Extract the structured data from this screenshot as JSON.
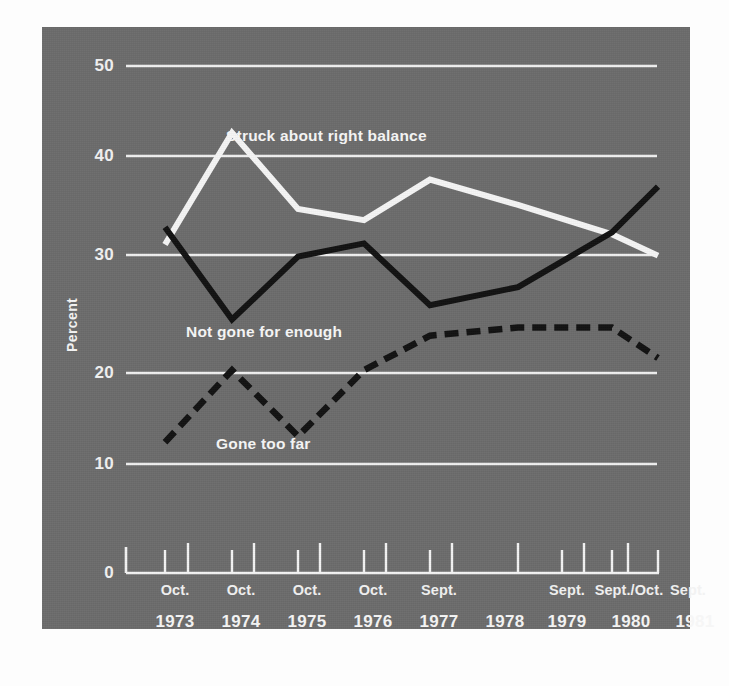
{
  "clipped_top_text": "g",
  "colors": {
    "panel_bg": "#6c6c6c",
    "grid": "#f0f0f0",
    "axis": "#f4f4f4",
    "series_white": "#f5f5f5",
    "series_black": "#111111",
    "text": "#f4f4f4",
    "page_bg": "#fdfdfd"
  },
  "chart_data": {
    "type": "line",
    "title": "",
    "xlabel": "",
    "ylabel": "Percent",
    "ylim": [
      0,
      50
    ],
    "yticks": [
      0,
      10,
      20,
      30,
      40,
      50
    ],
    "grid": true,
    "grid_axis": "y",
    "legend": "inline-annotations",
    "x": [
      "Oct. 1973",
      "1974a",
      "Oct. 1974",
      "1975a",
      "Oct. 1975",
      "1976a",
      "Oct. 1976",
      "1977a",
      "Sept. 1977",
      "1978",
      "Sept. 1979",
      "1980a",
      "Sept./Oct. 1980",
      "1981a",
      "Sept. 1981"
    ],
    "x_axis_years": [
      "1973",
      "1974",
      "1975",
      "1976",
      "1977",
      "1978",
      "1979",
      "1980",
      "1981"
    ],
    "x_axis_months": [
      "Oct.",
      "Oct.",
      "Oct.",
      "Oct.",
      "Sept.",
      "",
      "Sept.",
      "Sept./Oct.",
      "Sept."
    ],
    "series": [
      {
        "name": "Struck about right balance",
        "style": "solid",
        "color": "#f5f5f5",
        "points": [
          {
            "x": "Oct. 1973",
            "y": 32.4
          },
          {
            "x": "Oct. 1974",
            "y": 43.4
          },
          {
            "x": "Oct. 1975",
            "y": 35.9
          },
          {
            "x": "Oct. 1976",
            "y": 34.8
          },
          {
            "x": "Sept. 1977",
            "y": 38.8
          },
          {
            "x": "Sept. 1979",
            "y": 36.3
          },
          {
            "x": "Sept./Oct. 1980",
            "y": 33.4
          },
          {
            "x": "Sept. 1981",
            "y": 31.3
          }
        ]
      },
      {
        "name": "Not gone for enough",
        "style": "solid",
        "color": "#111111",
        "points": [
          {
            "x": "Oct. 1973",
            "y": 34.1
          },
          {
            "x": "Oct. 1974",
            "y": 25.0
          },
          {
            "x": "Oct. 1975",
            "y": 31.2
          },
          {
            "x": "Oct. 1976",
            "y": 32.5
          },
          {
            "x": "Sept. 1977",
            "y": 26.4
          },
          {
            "x": "Sept. 1979",
            "y": 28.2
          },
          {
            "x": "Sept./Oct. 1980",
            "y": 33.6
          },
          {
            "x": "Sept. 1981",
            "y": 38.1
          }
        ]
      },
      {
        "name": "Gone too far",
        "style": "dashed",
        "color": "#111111",
        "points": [
          {
            "x": "Oct. 1973",
            "y": 12.9
          },
          {
            "x": "Oct. 1974",
            "y": 20.0
          },
          {
            "x": "Oct. 1975",
            "y": 13.5
          },
          {
            "x": "Oct. 1976",
            "y": 20.0
          },
          {
            "x": "Sept. 1977",
            "y": 23.4
          },
          {
            "x": "Sept. 1979",
            "y": 24.2
          },
          {
            "x": "Sept./Oct. 1980",
            "y": 24.2
          },
          {
            "x": "Sept. 1981",
            "y": 21.2
          }
        ]
      }
    ],
    "annotations": [
      {
        "text": "Struck about right balance",
        "series": "Struck about right balance"
      },
      {
        "text": "Not gone for enough",
        "series": "Not gone for enough"
      },
      {
        "text": "Gone too far",
        "series": "Gone too far"
      }
    ]
  }
}
